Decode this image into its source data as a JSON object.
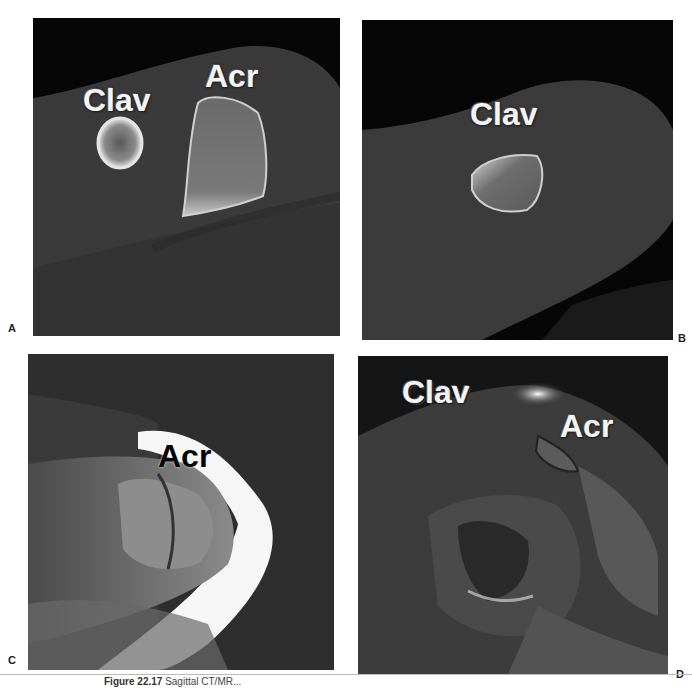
{
  "figure": {
    "caption_label": "Figure 22.17",
    "caption_text": "Sagittal CT/MR..."
  },
  "panels": [
    {
      "id": "A",
      "modality": "CT sagittal",
      "letter": "A",
      "labels": [
        {
          "text": "Clav",
          "x": 50,
          "y": 64
        },
        {
          "text": "Acr",
          "x": 172,
          "y": 44
        }
      ]
    },
    {
      "id": "B",
      "modality": "CT sagittal",
      "letter": "B",
      "labels": [
        {
          "text": "Clav",
          "x": 108,
          "y": 78
        }
      ]
    },
    {
      "id": "C",
      "modality": "MR sagittal",
      "letter": "C",
      "labels": [
        {
          "text": "Acr",
          "x": 130,
          "y": 88
        }
      ]
    },
    {
      "id": "D",
      "modality": "MR sagittal",
      "letter": "D",
      "labels": [
        {
          "text": "Clav",
          "x": 44,
          "y": 22
        },
        {
          "text": "Acr",
          "x": 202,
          "y": 56
        }
      ]
    }
  ]
}
